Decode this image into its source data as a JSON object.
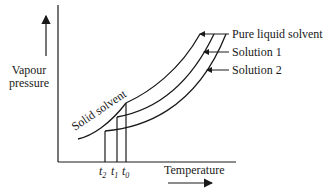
{
  "diagram": {
    "type": "phase-diagram",
    "y_axis_label_line1": "Vapour",
    "y_axis_label_line2": "pressure",
    "x_axis_label": "Temperature",
    "curves": [
      {
        "name": "Pure liquid solvent",
        "label": "Pure liquid solvent"
      },
      {
        "name": "Solution 1",
        "label": "Solution 1"
      },
      {
        "name": "Solution 2",
        "label": "Solution 2"
      },
      {
        "name": "Solid solvent",
        "label": "Solid solvent"
      }
    ],
    "ticks": [
      {
        "label": "t",
        "sub": "2"
      },
      {
        "label": "t",
        "sub": "1"
      },
      {
        "label": "t",
        "sub": "0"
      }
    ],
    "colors": {
      "line": "#1a1a1a",
      "background": "#ffffff"
    }
  }
}
